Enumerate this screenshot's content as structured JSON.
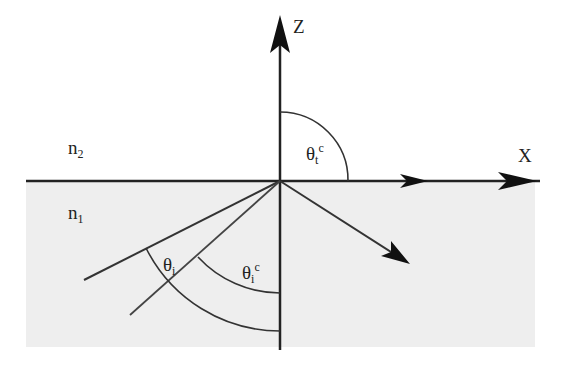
{
  "diagram": {
    "title": "",
    "axes": {
      "z_label": "Z",
      "x_label": "X"
    },
    "media": {
      "upper": {
        "label_base": "n",
        "label_sub": "2"
      },
      "lower": {
        "label_base": "n",
        "label_sub": "1"
      }
    },
    "angles": {
      "transmitted_critical": {
        "base": "θ",
        "sub": "t",
        "sup": "c"
      },
      "incident": {
        "base": "θ",
        "sub": "i"
      },
      "incident_critical": {
        "base": "θ",
        "sub": "i",
        "sup": "c"
      }
    },
    "colors": {
      "lower_medium_fill": "#eeeeee",
      "line": "#333333",
      "arrow": "#111111"
    }
  }
}
